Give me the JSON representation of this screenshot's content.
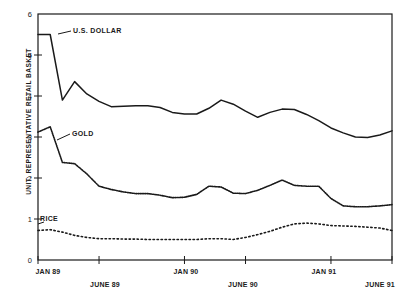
{
  "chart_data": {
    "type": "line",
    "title": "",
    "xlabel": "",
    "ylabel": "UNIT: REPRESENTATIVE RETAIL BASKET",
    "ylim": [
      0,
      6
    ],
    "xlim": [
      0,
      29
    ],
    "grid": false,
    "legend_position": "inline-annotations",
    "ytick_labels": [
      "6",
      "5",
      "4",
      "3",
      "2",
      "1",
      "0"
    ],
    "ytick_values": [
      6,
      5,
      4,
      3,
      2,
      1,
      0
    ],
    "xtick_labels": [
      "JAN 89",
      "JUNE 89",
      "JAN 90",
      "JUNE 90",
      "JAN 91",
      "JUNE 91"
    ],
    "xtick_indices": [
      0,
      5,
      12,
      17,
      24,
      29
    ],
    "x": [
      0,
      1,
      2,
      3,
      4,
      5,
      6,
      7,
      8,
      9,
      10,
      11,
      12,
      13,
      14,
      15,
      16,
      17,
      18,
      19,
      20,
      21,
      22,
      23,
      24,
      25,
      26,
      27,
      28,
      29
    ],
    "series": [
      {
        "name": "U.S. DOLLAR",
        "style": "solid",
        "color": "#1a1a1a",
        "label_x_index": 2,
        "values": [
          5.5,
          5.5,
          3.9,
          4.35,
          4.05,
          3.87,
          3.74,
          3.75,
          3.76,
          3.76,
          3.72,
          3.6,
          3.56,
          3.56,
          3.7,
          3.9,
          3.8,
          3.63,
          3.48,
          3.6,
          3.68,
          3.67,
          3.55,
          3.4,
          3.22,
          3.1,
          3.0,
          2.99,
          3.05,
          3.15
        ]
      },
      {
        "name": "GOLD",
        "style": "fine-dotted",
        "color": "#1a1a1a",
        "label_x_index": 2,
        "values": [
          3.12,
          3.25,
          2.38,
          2.35,
          2.1,
          1.8,
          1.72,
          1.66,
          1.62,
          1.62,
          1.58,
          1.52,
          1.53,
          1.6,
          1.8,
          1.78,
          1.63,
          1.62,
          1.7,
          1.82,
          1.95,
          1.82,
          1.8,
          1.8,
          1.5,
          1.32,
          1.3,
          1.3,
          1.32,
          1.35
        ]
      },
      {
        "name": "RICE",
        "style": "coarse-dotted",
        "color": "#1a1a1a",
        "label_x_index": 1,
        "values": [
          0.72,
          0.74,
          0.68,
          0.6,
          0.55,
          0.52,
          0.52,
          0.51,
          0.51,
          0.5,
          0.5,
          0.5,
          0.5,
          0.5,
          0.52,
          0.52,
          0.5,
          0.55,
          0.62,
          0.7,
          0.8,
          0.88,
          0.9,
          0.88,
          0.84,
          0.83,
          0.82,
          0.8,
          0.78,
          0.72
        ]
      }
    ]
  },
  "axis": {
    "frame_color": "#1a1a1a"
  }
}
